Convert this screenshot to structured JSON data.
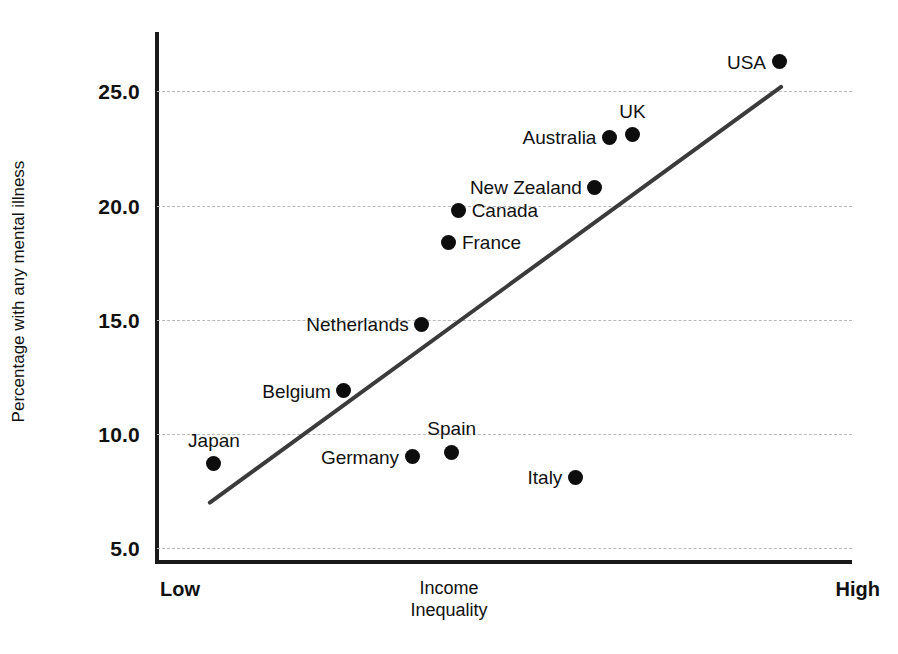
{
  "chart_data": {
    "type": "scatter",
    "title": "",
    "xlabel": "Income Inequality",
    "ylabel": "Percentage with any mental illness",
    "x_axis": {
      "low_label": "Low",
      "high_label": "High",
      "title_line1": "Income",
      "title_line2": "Inequality",
      "ticks": []
    },
    "y_axis": {
      "ticks": [
        "5.0",
        "10.0",
        "15.0",
        "20.0",
        "25.0"
      ],
      "tick_values": [
        5.0,
        10.0,
        15.0,
        20.0,
        25.0
      ],
      "ylim": [
        4.4,
        27.6
      ],
      "grid": true
    },
    "grid": true,
    "legend": "none",
    "point_color": "#0d0d0d",
    "trendline_color": "#3b3b3b",
    "gridline_color": "#b9b9b9",
    "axis_color": "#1a1a1a",
    "points": [
      {
        "name": "USA",
        "x": 0.895,
        "y": 26.3,
        "label_pos": "left"
      },
      {
        "name": "UK",
        "x": 0.684,
        "y": 23.1,
        "label_pos": "above"
      },
      {
        "name": "Australia",
        "x": 0.651,
        "y": 23.0,
        "label_pos": "left"
      },
      {
        "name": "New Zealand",
        "x": 0.63,
        "y": 20.8,
        "label_pos": "left"
      },
      {
        "name": "Canada",
        "x": 0.434,
        "y": 19.8,
        "label_pos": "right"
      },
      {
        "name": "France",
        "x": 0.42,
        "y": 18.4,
        "label_pos": "right"
      },
      {
        "name": "Netherlands",
        "x": 0.381,
        "y": 14.8,
        "label_pos": "left"
      },
      {
        "name": "Belgium",
        "x": 0.269,
        "y": 11.9,
        "label_pos": "left"
      },
      {
        "name": "Spain",
        "x": 0.424,
        "y": 9.2,
        "label_pos": "above"
      },
      {
        "name": "Germany",
        "x": 0.367,
        "y": 9.0,
        "label_pos": "left"
      },
      {
        "name": "Japan",
        "x": 0.082,
        "y": 8.7,
        "label_pos": "above"
      },
      {
        "name": "Italy",
        "x": 0.602,
        "y": 8.1,
        "label_pos": "left"
      }
    ],
    "trendline": {
      "x_start": 0.076,
      "y_start": 7.0,
      "x_end": 0.898,
      "y_end": 25.2
    }
  }
}
